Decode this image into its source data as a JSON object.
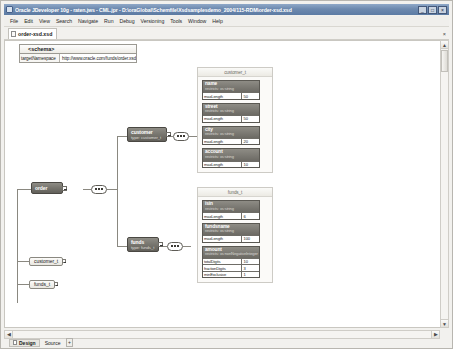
{
  "window": {
    "title": "Oracle JDeveloper 10g - raten.jws - CML.jpr - D:\\oraGlobal\\Schemfile\\Xsdsamplesdemo_2004/115-RDM\\order-xsd.xsd",
    "buttons": {
      "minimize": "_",
      "maximize": "□",
      "close": "×"
    }
  },
  "menu": {
    "items": [
      "File",
      "Edit",
      "View",
      "Search",
      "Navigate",
      "Run",
      "Debug",
      "Versioning",
      "Tools",
      "Window",
      "Help"
    ]
  },
  "document_tab": {
    "label": "order-xsd.xsd",
    "icon": "xml-file-icon",
    "close": "×"
  },
  "schema_node": {
    "title": "<schema>",
    "rows": [
      {
        "key": "targetNamespace",
        "value": "http://www.oracle.com/funds/order.xsd"
      }
    ]
  },
  "diagram": {
    "elements": [
      {
        "name": "order",
        "type": ""
      },
      {
        "name": "customer",
        "type": "type: customer_t"
      },
      {
        "name": "funds",
        "type": "type: funds_t"
      }
    ],
    "global_types": [
      {
        "name": "customer_t"
      },
      {
        "name": "funds_t"
      }
    ],
    "type_panels": [
      {
        "title": "customer_t",
        "attributes": [
          {
            "name": "name",
            "restricts": "restricts: xs:string",
            "facets": [
              {
                "key": "maxLength",
                "value": "50"
              }
            ]
          },
          {
            "name": "street",
            "restricts": "restricts: xs:string",
            "facets": [
              {
                "key": "maxLength",
                "value": "50"
              }
            ]
          },
          {
            "name": "city",
            "restricts": "restricts: xs:string",
            "facets": [
              {
                "key": "maxLength",
                "value": "20"
              }
            ]
          },
          {
            "name": "account",
            "restricts": "restricts: xs:string",
            "facets": [
              {
                "key": "maxLength",
                "value": "10"
              }
            ]
          }
        ]
      },
      {
        "title": "funds_t",
        "attributes": [
          {
            "name": "isin",
            "restricts": "restricts: xs:string",
            "facets": [
              {
                "key": "maxLength",
                "value": "6"
              }
            ]
          },
          {
            "name": "fundsname",
            "restricts": "restricts: xs:string",
            "facets": [
              {
                "key": "maxLength",
                "value": "100"
              }
            ]
          },
          {
            "name": "amount",
            "restricts": "restricts: xs:nonNegativeInteger",
            "facets": [
              {
                "key": "totalDigits",
                "value": "10"
              },
              {
                "key": "fractionDigits",
                "value": "3"
              },
              {
                "key": "minExclusive",
                "value": "1"
              }
            ]
          }
        ]
      }
    ]
  },
  "scrollbars": {
    "vertical": {
      "up": "▲",
      "down": "▼"
    },
    "horizontal": {
      "left": "◀",
      "right": "▶"
    }
  },
  "bottom_tabs": {
    "items": [
      {
        "label": "Design",
        "active": true
      },
      {
        "label": "Source",
        "active": false
      }
    ],
    "more": "+"
  },
  "colors": {
    "title_bar": "#5c7ba4",
    "element_node": "#77756e",
    "canvas": "#ffffff",
    "chrome": "#f2f1ee"
  }
}
